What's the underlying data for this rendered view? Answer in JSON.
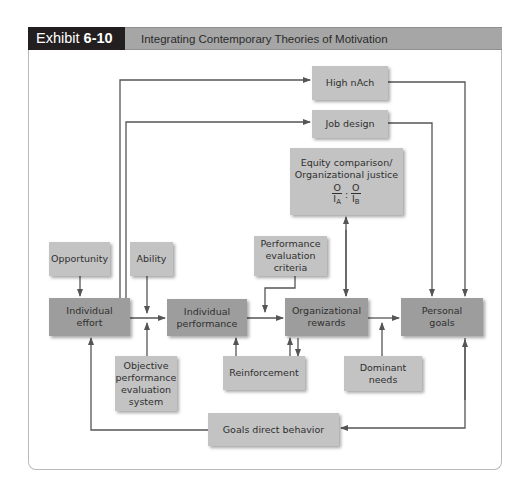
{
  "header": {
    "exhibit_prefix": "Exhibit ",
    "exhibit_number": "6-10",
    "title": "Integrating Contemporary Theories of Motivation"
  },
  "colors": {
    "header_dark": "#231f20",
    "header_gray": "#a6a6a6",
    "box_light": "#c3c3c3",
    "box_dark": "#9d9d9d",
    "line": "#555555"
  },
  "nodes": {
    "high_nach": "High nAch",
    "job_design": "Job design",
    "equity_line1": "Equity comparison/",
    "equity_line2": "Organizational justice",
    "ratio_num_a": "O",
    "ratio_den_a": "I",
    "ratio_sub_a": "A",
    "ratio_sep": ":",
    "ratio_num_b": "O",
    "ratio_den_b": "I",
    "ratio_sub_b": "B",
    "opportunity": "Opportunity",
    "ability": "Ability",
    "individual_effort_1": "Individual",
    "individual_effort_2": "effort",
    "individual_performance_1": "Individual",
    "individual_performance_2": "performance",
    "perf_eval_criteria_1": "Performance",
    "perf_eval_criteria_2": "evaluation",
    "perf_eval_criteria_3": "criteria",
    "org_rewards_1": "Organizational",
    "org_rewards_2": "rewards",
    "personal_goals_1": "Personal",
    "personal_goals_2": "goals",
    "objective_eval_1": "Objective",
    "objective_eval_2": "performance",
    "objective_eval_3": "evaluation",
    "objective_eval_4": "system",
    "reinforcement": "Reinforcement",
    "dominant_needs_1": "Dominant",
    "dominant_needs_2": "needs",
    "goals_direct_behavior": "Goals direct behavior"
  }
}
